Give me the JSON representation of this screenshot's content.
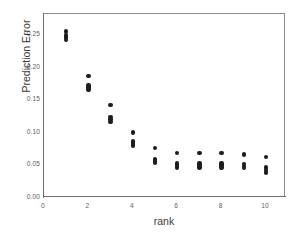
{
  "chart_data": {
    "type": "scatter",
    "title": "",
    "xlabel": "rank",
    "ylabel": "Prediction Error",
    "xlim": [
      0,
      10.9
    ],
    "ylim": [
      0.0,
      0.283
    ],
    "grid": false,
    "legend": null,
    "xticks": [
      "0",
      "2",
      "4",
      "6",
      "8",
      "10"
    ],
    "xtick_values": [
      0,
      2,
      4,
      6,
      8,
      10
    ],
    "yticks": [
      "0.00",
      "0.05",
      "0.10",
      "0.15",
      "0.20",
      "0.25"
    ],
    "ytick_values": [
      0.0,
      0.05,
      0.1,
      0.15,
      0.2,
      0.25
    ],
    "marker": "filled-circle",
    "marker_color": "#1d1d1d",
    "series": [
      {
        "name": "prediction error replicates",
        "points": [
          {
            "x": 1,
            "y": 0.256
          },
          {
            "x": 1,
            "y": 0.25
          },
          {
            "x": 1,
            "y": 0.247
          },
          {
            "x": 1,
            "y": 0.243
          },
          {
            "x": 2,
            "y": 0.188
          },
          {
            "x": 2,
            "y": 0.173
          },
          {
            "x": 2,
            "y": 0.17
          },
          {
            "x": 2,
            "y": 0.167
          },
          {
            "x": 3,
            "y": 0.143
          },
          {
            "x": 3,
            "y": 0.125
          },
          {
            "x": 3,
            "y": 0.121
          },
          {
            "x": 3,
            "y": 0.117
          },
          {
            "x": 4,
            "y": 0.101
          },
          {
            "x": 4,
            "y": 0.087
          },
          {
            "x": 4,
            "y": 0.084
          },
          {
            "x": 4,
            "y": 0.081
          },
          {
            "x": 5,
            "y": 0.077
          },
          {
            "x": 5,
            "y": 0.059
          },
          {
            "x": 5,
            "y": 0.056
          },
          {
            "x": 5,
            "y": 0.054
          },
          {
            "x": 6,
            "y": 0.069
          },
          {
            "x": 6,
            "y": 0.053
          },
          {
            "x": 6,
            "y": 0.05
          },
          {
            "x": 6,
            "y": 0.047
          },
          {
            "x": 7,
            "y": 0.069
          },
          {
            "x": 7,
            "y": 0.053
          },
          {
            "x": 7,
            "y": 0.05
          },
          {
            "x": 7,
            "y": 0.047
          },
          {
            "x": 8,
            "y": 0.069
          },
          {
            "x": 8,
            "y": 0.053
          },
          {
            "x": 8,
            "y": 0.05
          },
          {
            "x": 8,
            "y": 0.047
          },
          {
            "x": 9,
            "y": 0.067
          },
          {
            "x": 9,
            "y": 0.052
          },
          {
            "x": 9,
            "y": 0.049
          },
          {
            "x": 9,
            "y": 0.046
          },
          {
            "x": 10,
            "y": 0.063
          },
          {
            "x": 10,
            "y": 0.047
          },
          {
            "x": 10,
            "y": 0.043
          },
          {
            "x": 10,
            "y": 0.039
          }
        ]
      }
    ]
  }
}
